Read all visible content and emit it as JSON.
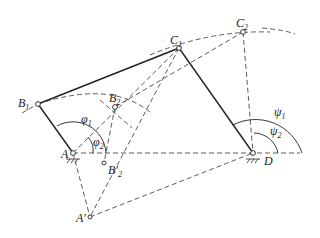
{
  "diagram": {
    "type": "four-bar linkage design (two positions)",
    "points": {
      "A": {
        "label": "A",
        "x": 73,
        "y": 153
      },
      "B1": {
        "label": "B",
        "sub": "1",
        "x": 38,
        "y": 104
      },
      "B2": {
        "label": "B",
        "sub": "2",
        "x": 115,
        "y": 107
      },
      "B2p": {
        "label": "B′",
        "sub": "2",
        "x": 104,
        "y": 163
      },
      "C1": {
        "label": "C",
        "sub": "1",
        "x": 179,
        "y": 48
      },
      "C2": {
        "label": "C",
        "sub": "2",
        "x": 243,
        "y": 32
      },
      "D": {
        "label": "D",
        "x": 253,
        "y": 153
      },
      "Ap": {
        "label": "A′",
        "x": 90,
        "y": 217
      }
    },
    "angles": {
      "phi1": {
        "label": "φ",
        "sub": "1"
      },
      "phi2": {
        "label": "φ",
        "sub": "2"
      },
      "psi1": {
        "label": "ψ",
        "sub": "1"
      },
      "psi2": {
        "label": "ψ",
        "sub": "2"
      }
    },
    "colors": {
      "ink": "#222222",
      "background": "#ffffff"
    }
  }
}
